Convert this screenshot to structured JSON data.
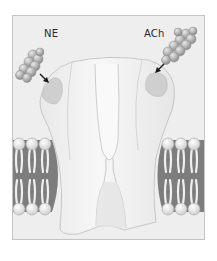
{
  "figure": {
    "labels": {
      "ligand_left": "NE",
      "ligand_right": "ACh"
    },
    "colors": {
      "background": "#ffffff",
      "frame_fill": "#eeeeee",
      "frame_border": "#c4c4c4",
      "receptor_fill": "#f3f3f3",
      "receptor_outline": "#bdbdbd",
      "binding_site": "#cfcfcf",
      "membrane_dark": "#7a7a7a",
      "lipid_head": "#e4e4e4",
      "ligand": "#b8b8b8",
      "arrow": "#1a1a1a",
      "label_text": "#2a2a2a"
    }
  }
}
